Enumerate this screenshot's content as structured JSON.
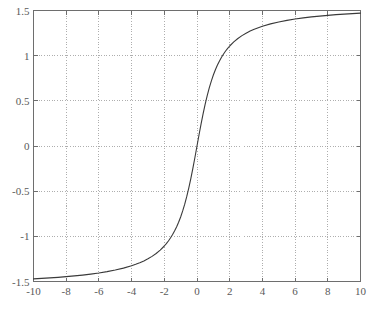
{
  "chart_data": {
    "type": "line",
    "title": "",
    "subtitle": "",
    "xlabel": "",
    "ylabel": "",
    "xlim": [
      -10,
      10
    ],
    "ylim": [
      -1.5,
      1.5
    ],
    "grid": true,
    "grid_style": "dotted",
    "legend": null,
    "legend_position": "none",
    "xticks": [
      -10,
      -8,
      -6,
      -4,
      -2,
      0,
      2,
      4,
      6,
      8,
      10
    ],
    "xtick_labels": [
      "-10",
      "-8",
      "-6",
      "-4",
      "-2",
      "0",
      "2",
      "4",
      "6",
      "8",
      "10"
    ],
    "yticks": [
      -1.5,
      -1,
      -0.5,
      0,
      0.5,
      1,
      1.5
    ],
    "ytick_labels": [
      "-1.5",
      "-1",
      "-0.5",
      "0",
      "0.5",
      "1",
      "1.5"
    ],
    "series": [
      {
        "name": "arctan(x)",
        "color": "#3a3a3a",
        "line_width": 1.1,
        "x": [
          -10,
          -9.5,
          -9,
          -8.5,
          -8,
          -7.5,
          -7,
          -6.5,
          -6,
          -5.5,
          -5,
          -4.5,
          -4,
          -3.75,
          -3.5,
          -3.25,
          -3,
          -2.75,
          -2.5,
          -2.25,
          -2,
          -1.875,
          -1.75,
          -1.625,
          -1.5,
          -1.375,
          -1.25,
          -1.125,
          -1,
          -0.875,
          -0.75,
          -0.625,
          -0.5,
          -0.375,
          -0.25,
          -0.125,
          0,
          0.125,
          0.25,
          0.375,
          0.5,
          0.625,
          0.75,
          0.875,
          1,
          1.125,
          1.25,
          1.375,
          1.5,
          1.625,
          1.75,
          1.875,
          2,
          2.25,
          2.5,
          2.75,
          3,
          3.25,
          3.5,
          3.75,
          4,
          4.5,
          5,
          5.5,
          6,
          6.5,
          7,
          7.5,
          8,
          8.5,
          9,
          9.5,
          10
        ],
        "y": [
          -1.4711,
          -1.4657,
          -1.4601,
          -1.4538,
          -1.4464,
          -1.4382,
          -1.4289,
          -1.4182,
          -1.4056,
          -1.3909,
          -1.3734,
          -1.3521,
          -1.3258,
          -1.3101,
          -1.2925,
          -1.2723,
          -1.249,
          -1.222,
          -1.1903,
          -1.1526,
          -1.1071,
          -1.0808,
          -1.0517,
          -1.0191,
          -0.9828,
          -0.942,
          -0.8961,
          -0.8441,
          -0.7854,
          -0.7188,
          -0.6435,
          -0.5586,
          -0.4636,
          -0.3588,
          -0.245,
          -0.1244,
          0,
          0.1244,
          0.245,
          0.3588,
          0.4636,
          0.5586,
          0.6435,
          0.7188,
          0.7854,
          0.8441,
          0.8961,
          0.942,
          0.9828,
          1.0191,
          1.0517,
          1.0808,
          1.1071,
          1.1526,
          1.1903,
          1.222,
          1.249,
          1.2723,
          1.2925,
          1.3101,
          1.3258,
          1.3521,
          1.3734,
          1.3909,
          1.4056,
          1.4182,
          1.4289,
          1.4382,
          1.4464,
          1.4538,
          1.4601,
          1.4657,
          1.4711
        ]
      }
    ],
    "annotations": []
  },
  "style": {
    "axis_color": "#6e6e6e",
    "grid_color": "#9a9a9a",
    "curve_color": "#3a3a3a",
    "label_color": "#595959",
    "background": "#ffffff"
  }
}
